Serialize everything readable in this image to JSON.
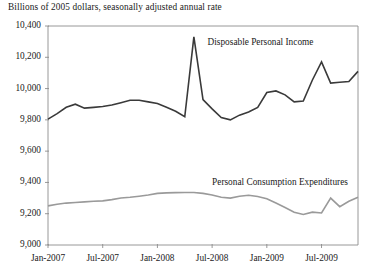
{
  "chart_data": {
    "type": "line",
    "title": "",
    "subtitle": "",
    "axis_note": "Billions of 2005 dollars, seasonally adjusted annual rate",
    "xlabel": "",
    "ylabel": "",
    "ylim": [
      9000,
      10400
    ],
    "ytick_values": [
      9000,
      9200,
      9400,
      9600,
      9800,
      10000,
      10200,
      10400
    ],
    "ytick_labels": [
      "9,000",
      "9,200",
      "9,400",
      "9,600",
      "9,800",
      "10,000",
      "10,200",
      "10,400"
    ],
    "xtick_labels": [
      "Jan-2007",
      "Jul-2007",
      "Jan-2008",
      "Jul-2008",
      "Jan-2009",
      "Jul-2009"
    ],
    "xtick_months": [
      0,
      6,
      12,
      18,
      24,
      30
    ],
    "x": [
      "Jan-2007",
      "Feb-2007",
      "Mar-2007",
      "Apr-2007",
      "May-2007",
      "Jun-2007",
      "Jul-2007",
      "Aug-2007",
      "Sep-2007",
      "Oct-2007",
      "Nov-2007",
      "Dec-2007",
      "Jan-2008",
      "Feb-2008",
      "Mar-2008",
      "Apr-2008",
      "May-2008",
      "Jun-2008",
      "Jul-2008",
      "Aug-2008",
      "Sep-2008",
      "Oct-2008",
      "Nov-2008",
      "Dec-2008",
      "Jan-2009",
      "Feb-2009",
      "Mar-2009",
      "Apr-2009",
      "May-2009",
      "Jun-2009",
      "Jul-2009",
      "Aug-2009",
      "Sep-2009",
      "Oct-2009",
      "Nov-2009"
    ],
    "grid": false,
    "legend": "inline-annotations",
    "series": [
      {
        "name": "Disposable Personal Income",
        "color": "#3a3a3a",
        "width": 1.6,
        "label_x_month": 17.5,
        "label_y_value": 10290,
        "values": [
          9805,
          9840,
          9880,
          9900,
          9875,
          9880,
          9885,
          9895,
          9910,
          9925,
          9925,
          9915,
          9905,
          9880,
          9855,
          9820,
          10330,
          9930,
          9870,
          9815,
          9800,
          9830,
          9850,
          9880,
          9975,
          9985,
          9960,
          9915,
          9920,
          10055,
          10170,
          10035,
          10040,
          10045,
          10110
        ]
      },
      {
        "name": "Personal Consumption Expenditures",
        "color": "#9a9a9a",
        "width": 1.6,
        "label_x_month": 18.0,
        "label_y_value": 9395,
        "values": [
          9250,
          9260,
          9268,
          9272,
          9276,
          9280,
          9282,
          9290,
          9300,
          9305,
          9312,
          9320,
          9330,
          9333,
          9335,
          9336,
          9336,
          9330,
          9320,
          9305,
          9300,
          9312,
          9318,
          9310,
          9295,
          9268,
          9240,
          9210,
          9195,
          9210,
          9205,
          9300,
          9245,
          9280,
          9305
        ]
      }
    ]
  },
  "plot_geometry": {
    "left": 48,
    "right": 358,
    "top": 26,
    "bottom": 245
  }
}
